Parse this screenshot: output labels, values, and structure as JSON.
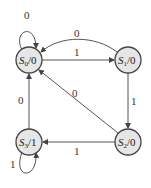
{
  "diagram": {
    "type": "state-machine",
    "states": [
      {
        "id": "S0",
        "name": "S",
        "sub": "0",
        "output": "/0"
      },
      {
        "id": "S1",
        "name": "S",
        "sub": "1",
        "output": "/0"
      },
      {
        "id": "S2",
        "name": "S",
        "sub": "2",
        "output": "/0"
      },
      {
        "id": "S3",
        "name": "S",
        "sub": "3",
        "output": "/1"
      }
    ],
    "transitions": [
      {
        "from": "S0",
        "to": "S0",
        "label": "0"
      },
      {
        "from": "S0",
        "to": "S1",
        "label": "1"
      },
      {
        "from": "S1",
        "to": "S0",
        "label": "0"
      },
      {
        "from": "S1",
        "to": "S2",
        "label": "1"
      },
      {
        "from": "S2",
        "to": "S0",
        "label": "0"
      },
      {
        "from": "S2",
        "to": "S3",
        "label": "1"
      },
      {
        "from": "S3",
        "to": "S0",
        "label": "0"
      },
      {
        "from": "S3",
        "to": "S3",
        "label": "1"
      }
    ],
    "colors": {
      "node_fill": "#e6e6e6",
      "stroke": "#444444"
    }
  }
}
